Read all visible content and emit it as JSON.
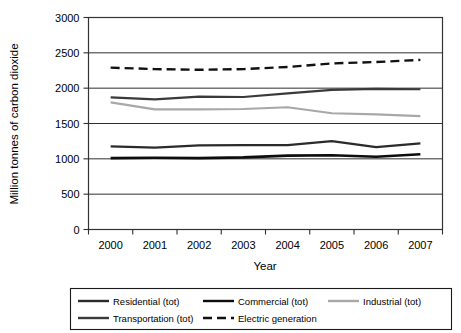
{
  "chart_data": {
    "type": "line",
    "title": "",
    "xlabel": "Year",
    "ylabel": "Million tonnes of carbon dioxide",
    "categories": [
      "2000",
      "2001",
      "2002",
      "2003",
      "2004",
      "2005",
      "2006",
      "2007"
    ],
    "x": [
      2000,
      2001,
      2002,
      2003,
      2004,
      2005,
      2006,
      2007
    ],
    "ylim": [
      0,
      3000
    ],
    "yticks": [
      0,
      500,
      1000,
      1500,
      2000,
      2500,
      3000
    ],
    "ytick_labels": [
      "0",
      "500",
      "1000",
      "1500",
      "2000",
      "2500",
      "3000"
    ],
    "grid": "horizontal",
    "legend_position": "bottom",
    "series": [
      {
        "name": "Residential (tot)",
        "color": "#2b2b2b",
        "style": "solid",
        "width": 2.2,
        "values": [
          1175,
          1160,
          1190,
          1195,
          1195,
          1250,
          1165,
          1220
        ]
      },
      {
        "name": "Commercial (tot)",
        "color": "#0d0d0d",
        "style": "solid",
        "width": 2.6,
        "values": [
          1010,
          1015,
          1010,
          1020,
          1045,
          1050,
          1030,
          1065
        ]
      },
      {
        "name": "Industrial (tot)",
        "color": "#a8a8a8",
        "style": "solid",
        "width": 2.2,
        "values": [
          1800,
          1700,
          1700,
          1705,
          1730,
          1645,
          1630,
          1605
        ]
      },
      {
        "name": "Transportation (tot)",
        "color": "#3a3a3a",
        "style": "solid",
        "width": 2.2,
        "values": [
          1870,
          1840,
          1880,
          1875,
          1925,
          1975,
          1990,
          1985
        ]
      },
      {
        "name": "Electric generation",
        "color": "#111111",
        "style": "dashed",
        "width": 2.4,
        "values": [
          2290,
          2270,
          2260,
          2270,
          2300,
          2350,
          2370,
          2400
        ]
      }
    ]
  },
  "axes": {
    "x_title": "Year",
    "y_title": "Million tonnes of carbon dioxide"
  },
  "legend": {
    "entries": [
      {
        "label": "Residential (tot)",
        "color": "#2b2b2b",
        "style": "solid"
      },
      {
        "label": "Commercial (tot)",
        "color": "#0d0d0d",
        "style": "solid"
      },
      {
        "label": "Industrial (tot)",
        "color": "#a8a8a8",
        "style": "solid"
      },
      {
        "label": "Transportation (tot)",
        "color": "#3a3a3a",
        "style": "solid"
      },
      {
        "label": "Electric generation",
        "color": "#111111",
        "style": "dashed"
      }
    ]
  }
}
